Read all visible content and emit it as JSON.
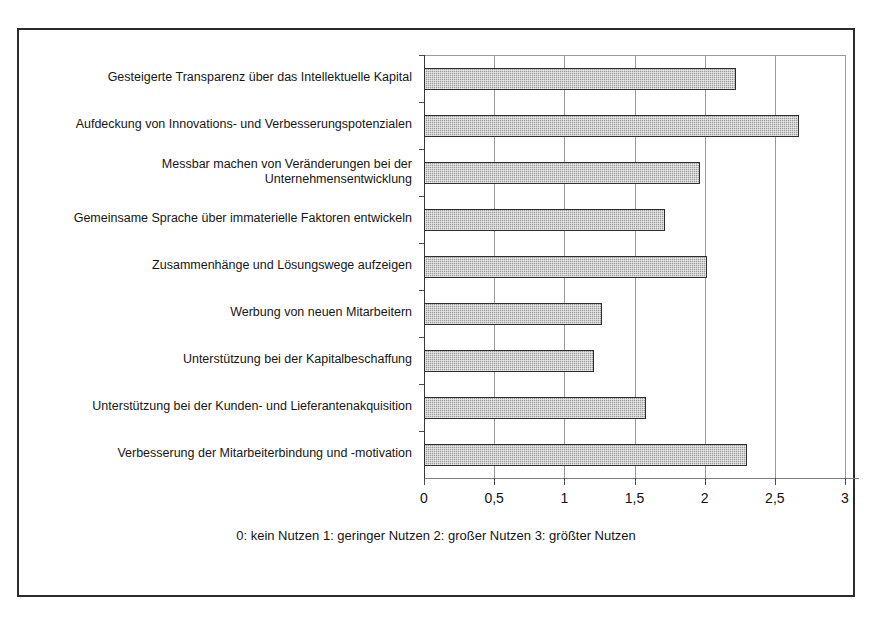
{
  "chart_data": {
    "type": "bar",
    "orientation": "horizontal",
    "title": "",
    "subtitle": "",
    "xlabel": "",
    "ylabel": "",
    "xlim": [
      0,
      3
    ],
    "grid": true,
    "legend": null,
    "categories": [
      "Gesteigerte Transparenz über das Intellektuelle Kapital",
      "Aufdeckung von Innovations- und Verbesserungspotenzialen",
      "Messbar machen von Veränderungen bei der\nUnternehmensentwicklung",
      "Gemeinsame Sprache über immaterielle Faktoren entwickeln",
      "Zusammenhänge und Lösungswege aufzeigen",
      "Werbung von neuen Mitarbeitern",
      "Unterstützung bei der Kapitalbeschaffung",
      "Unterstützung bei der Kunden- und Lieferantenakquisition",
      "Verbesserung der Mitarbeiterbindung und -motivation"
    ],
    "values": [
      2.22,
      2.67,
      1.97,
      1.72,
      2.02,
      1.27,
      1.21,
      1.58,
      2.3
    ],
    "xticks": [
      0,
      0.5,
      1,
      1.5,
      2,
      2.5,
      3
    ],
    "xtick_labels": [
      "0",
      "0,5",
      "1",
      "1,5",
      "2",
      "2,5",
      "3"
    ],
    "annotation": "0: kein Nutzen  1: geringer Nutzen   2: großer Nutzen  3: größter Nutzen",
    "bar_fill_color": "#9d9d9d",
    "bar_border_color": "#2e2e2e",
    "gridline_color": "#9a9a9a",
    "frame_color": "#2b2b2b"
  }
}
